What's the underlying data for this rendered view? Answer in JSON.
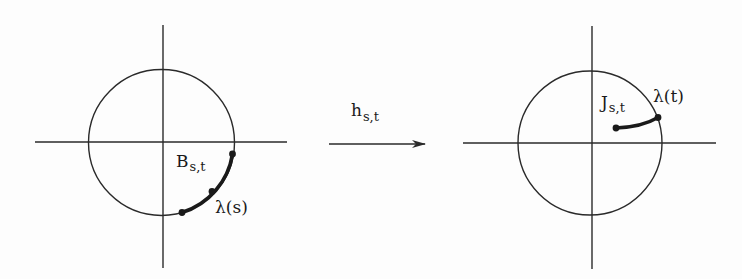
{
  "diagram": {
    "left_panel": {
      "arc_label_main": "B",
      "arc_label_sub": "s,t",
      "point_label": "λ(s)"
    },
    "arrow": {
      "label_main": "h",
      "label_sub": "s,t"
    },
    "right_panel": {
      "curve_label_main": "J",
      "curve_label_sub": "s,t",
      "point_label": "λ(t)"
    },
    "colors": {
      "stroke": "#2a2a2a",
      "background": "#fdfdfd"
    }
  }
}
